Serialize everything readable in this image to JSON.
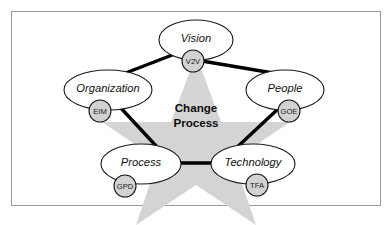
{
  "figure": {
    "title": "Change Process",
    "center": {
      "line1": "Change",
      "line2": "Process",
      "shape": "five-point-star",
      "fill_color": "#d4d4d4"
    },
    "frame": {
      "border_color": "#9a9a9a",
      "background_color": "#ffffff"
    },
    "edge_color": "#000000",
    "node_fill_color": "#ffffff",
    "node_stroke_color": "#1a1a1a",
    "abbr_fill_color": "#d2d2d2",
    "nodes": [
      {
        "label": "Vision",
        "abbr": "V2V",
        "position": "top",
        "cx": 196,
        "cy": 40,
        "rx": 37,
        "ry": 20,
        "abbr_cx": 193,
        "abbr_cy": 61,
        "abbr_r": 11
      },
      {
        "label": "People",
        "abbr": "GOE",
        "position": "right",
        "cx": 285,
        "cy": 90,
        "rx": 39,
        "ry": 20,
        "abbr_cx": 289,
        "abbr_cy": 111,
        "abbr_r": 11
      },
      {
        "label": "Technology",
        "abbr": "TFA",
        "position": "bottom-right",
        "cx": 253,
        "cy": 164,
        "rx": 42,
        "ry": 20,
        "abbr_cx": 257,
        "abbr_cy": 185,
        "abbr_r": 11
      },
      {
        "label": "Process",
        "abbr": "GPD",
        "position": "bottom-left",
        "cx": 141,
        "cy": 164,
        "rx": 40,
        "ry": 20,
        "abbr_cx": 125,
        "abbr_cy": 186,
        "abbr_r": 11
      },
      {
        "label": "Organization",
        "abbr": "EIM",
        "position": "left",
        "cx": 108,
        "cy": 90,
        "rx": 44,
        "ry": 20,
        "abbr_cx": 100,
        "abbr_cy": 111,
        "abbr_r": 11
      }
    ]
  }
}
